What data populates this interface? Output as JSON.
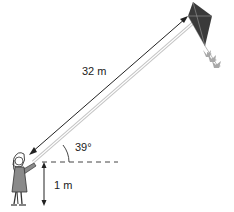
{
  "diagram": {
    "labels": {
      "string_length": "32 m",
      "angle": "39°",
      "hand_height": "1 m"
    },
    "colors": {
      "kite": "#3a3a3a",
      "tail": "#a8a8a8",
      "string": "#bdbdbd",
      "lines": "#222222",
      "figure": "#8a8a8a"
    }
  }
}
